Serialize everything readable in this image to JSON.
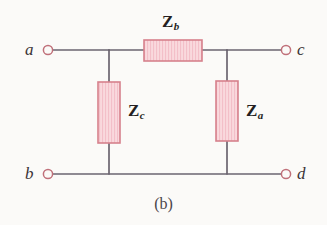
{
  "figure": {
    "caption": "(b)",
    "kind": "bridge-network-schematic",
    "background_color": "#fbfaf8",
    "wire_color": "#6b6470",
    "terminal_circle_stroke": "#c0707a",
    "component_border_color": "#d6818c",
    "component_fill_color": "#f9d9dd",
    "component_hatch_color": "#f2b9c2",
    "label_color": "#241f22",
    "node_label_color": "#3a3336"
  },
  "nodes": [
    {
      "id": "a",
      "label": "a",
      "label_x": 27,
      "label_y": 42,
      "cx": 48,
      "cy": 50,
      "r": 4.6
    },
    {
      "id": "c",
      "label": "c",
      "label_x": 297,
      "label_y": 42,
      "cx": 286,
      "cy": 50,
      "r": 4.6
    },
    {
      "id": "b",
      "label": "b",
      "label_x": 27,
      "label_y": 166,
      "cx": 48,
      "cy": 174,
      "r": 4.6
    },
    {
      "id": "d",
      "label": "d",
      "label_x": 297,
      "label_y": 166,
      "cx": 286,
      "cy": 174,
      "r": 4.6
    }
  ],
  "components": [
    {
      "id": "Zb",
      "symbol": "Z",
      "subscript": "b",
      "orientation": "horizontal",
      "x": 144,
      "y": 40,
      "width": 58,
      "height": 21,
      "label_x": 162,
      "label_y": 14,
      "connects": [
        "a-c top rail"
      ]
    },
    {
      "id": "Zc",
      "symbol": "Z",
      "subscript": "c",
      "orientation": "vertical",
      "x": 98,
      "y": 82,
      "width": 22,
      "height": 61,
      "label_x": 128,
      "label_y": 103,
      "connects": [
        "top rail node",
        "bottom rail node"
      ]
    },
    {
      "id": "Za",
      "symbol": "Z",
      "subscript": "a",
      "orientation": "vertical",
      "x": 216,
      "y": 81,
      "width": 22,
      "height": 60,
      "label_x": 246,
      "label_y": 103,
      "connects": [
        "top rail node",
        "bottom rail node"
      ]
    }
  ],
  "wires": [
    {
      "name": "a-to-left-junction",
      "x1": 53,
      "y1": 50,
      "x2": 109,
      "y2": 50
    },
    {
      "name": "left-junction-to-Zb",
      "x1": 109,
      "y1": 50,
      "x2": 144,
      "y2": 50
    },
    {
      "name": "Zb-to-right-junction",
      "x1": 202,
      "y1": 50,
      "x2": 227,
      "y2": 50
    },
    {
      "name": "right-junction-to-c",
      "x1": 227,
      "y1": 50,
      "x2": 281,
      "y2": 50
    },
    {
      "name": "left-vertical-top",
      "x1": 109,
      "y1": 50,
      "x2": 109,
      "y2": 82
    },
    {
      "name": "left-vertical-bottom",
      "x1": 109,
      "y1": 143,
      "x2": 109,
      "y2": 174
    },
    {
      "name": "right-vertical-top",
      "x1": 227,
      "y1": 50,
      "x2": 227,
      "y2": 81
    },
    {
      "name": "right-vertical-bottom",
      "x1": 227,
      "y1": 141,
      "x2": 227,
      "y2": 174
    },
    {
      "name": "b-to-d-bottom-rail",
      "x1": 53,
      "y1": 174,
      "x2": 281,
      "y2": 174
    }
  ]
}
